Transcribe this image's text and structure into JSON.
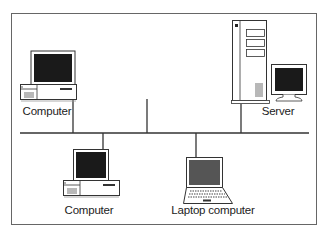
{
  "diagram": {
    "type": "network-bus-topology",
    "colors": {
      "line": "#333333",
      "frame": "#555555",
      "screen_dark": "#1a1a1a",
      "laptop_screen": "#555555",
      "device_fill": "#ffffff"
    },
    "nodes": [
      {
        "id": "computer-top-left",
        "kind": "desktop-computer",
        "label": "Computer"
      },
      {
        "id": "server",
        "kind": "server",
        "label": "Server"
      },
      {
        "id": "computer-bottom",
        "kind": "desktop-computer",
        "label": "Computer"
      },
      {
        "id": "laptop",
        "kind": "laptop-computer",
        "label": "Laptop computer"
      }
    ],
    "bus": {
      "label": ""
    }
  }
}
